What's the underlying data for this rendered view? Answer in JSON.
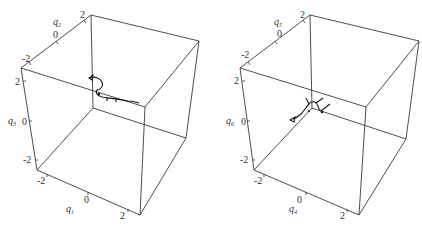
{
  "panels": [
    {
      "id": "left",
      "axes": {
        "depth": {
          "label": "q",
          "sub": "2",
          "ticks": [
            "-2",
            "0",
            "2"
          ]
        },
        "vertical": {
          "label": "q",
          "sub": "3",
          "ticks": [
            "2",
            "0",
            "-2"
          ]
        },
        "horizontal": {
          "label": "q",
          "sub": "1",
          "ticks": [
            "-2",
            "0",
            "2"
          ]
        }
      }
    },
    {
      "id": "right",
      "axes": {
        "depth": {
          "label": "q",
          "sub": "5",
          "ticks": [
            "-2",
            "0",
            "2"
          ]
        },
        "vertical": {
          "label": "q",
          "sub": "6",
          "ticks": [
            "2",
            "0",
            "-2"
          ]
        },
        "horizontal": {
          "label": "q",
          "sub": "4",
          "ticks": [
            "-2",
            "0",
            "2"
          ]
        }
      }
    }
  ],
  "colors": {
    "edge": "#3a3a3a",
    "trajectory": "#1a1a1a",
    "background": "#ffffff"
  }
}
